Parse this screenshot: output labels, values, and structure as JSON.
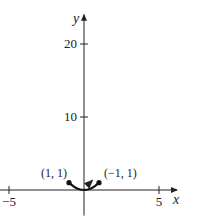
{
  "chart_data": {
    "type": "line",
    "title": "",
    "xlabel": "x",
    "ylabel": "y",
    "xlim": [
      -5.6,
      6.2
    ],
    "ylim": [
      -3.5,
      24
    ],
    "x_ticks": [
      {
        "value": -5,
        "label": "−5"
      },
      {
        "value": 5,
        "label": "5"
      }
    ],
    "y_ticks": [
      {
        "value": 10,
        "label": "10"
      },
      {
        "value": 20,
        "label": "20"
      }
    ],
    "grid": false,
    "series": [
      {
        "name": "curve",
        "x": [
          -1,
          -0.75,
          -0.5,
          -0.25,
          0,
          0.25,
          0.5,
          0.75,
          1
        ],
        "y": [
          1,
          0.5625,
          0.25,
          0.0625,
          0,
          0.0625,
          0.25,
          0.5625,
          1
        ],
        "endpoints": [
          {
            "x": -1,
            "y": 1,
            "label": "(1, 1)"
          },
          {
            "x": 1,
            "y": 1,
            "label": "(−1, 1)"
          }
        ],
        "direction_arrow": true
      }
    ]
  }
}
